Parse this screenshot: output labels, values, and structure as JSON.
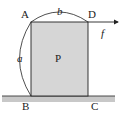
{
  "diagram": {
    "block_label": "P",
    "vertices": {
      "A": "A",
      "B": "B",
      "C": "C",
      "D": "D"
    },
    "dimensions": {
      "height": "a",
      "width": "b"
    },
    "force": {
      "label": "f",
      "applied_at": "D",
      "direction": "right"
    },
    "colors": {
      "block_fill": "#d6d6d6",
      "ground_fill": "#c8c8c8",
      "stroke": "#222222"
    }
  }
}
